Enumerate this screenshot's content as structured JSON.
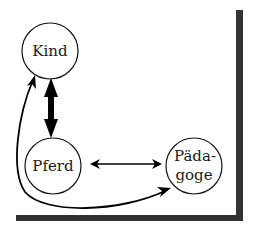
{
  "diagram": {
    "nodes": [
      {
        "id": "kind",
        "label_lines": [
          "Kind"
        ],
        "cx": 50,
        "cy": 51,
        "r": 28
      },
      {
        "id": "pferd",
        "label_lines": [
          "Pferd"
        ],
        "cx": 53,
        "cy": 166,
        "r": 28
      },
      {
        "id": "paedagoge",
        "label_lines": [
          "Päda-",
          "goge"
        ],
        "cx": 194,
        "cy": 166,
        "r": 28
      }
    ],
    "edges": [
      {
        "from": "kind",
        "to": "pferd",
        "style": "thick-bidirectional"
      },
      {
        "from": "pferd",
        "to": "paedagoge",
        "style": "thin-bidirectional"
      },
      {
        "from": "kind",
        "to": "paedagoge",
        "style": "curved-bidirectional"
      }
    ],
    "colors": {
      "stroke": "#111111",
      "frame": "#333333",
      "background": "#ffffff"
    }
  }
}
